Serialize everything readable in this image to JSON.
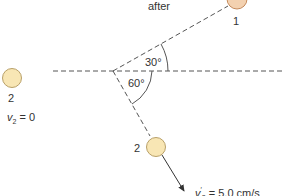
{
  "title": "after",
  "colors": {
    "ball1_fill": "#F3D1B0",
    "ball1_stroke": "#C48A5C",
    "ball2_fill": "#F8E6B4",
    "ball2_stroke": "#B8A068",
    "line": "#555555"
  },
  "ball1": {
    "label": "1"
  },
  "ball2_initial": {
    "label": "2",
    "velocity_symbol": "v",
    "velocity_sub": "2",
    "velocity_rest": " = 0"
  },
  "ball2_final": {
    "label": "2",
    "velocity_symbol": "v",
    "velocity_sup": "′",
    "velocity_sub": "2",
    "velocity_rest": " = 5.0 cm/s"
  },
  "angles": {
    "upper": "30°",
    "lower": "60°"
  }
}
